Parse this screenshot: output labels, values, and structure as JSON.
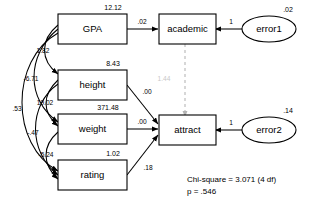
{
  "diagram": {
    "type": "sem-path-diagram",
    "title": "",
    "background_color": "#ffffff",
    "line_color": "#000000",
    "faded_color": "#c8c8c8"
  },
  "observed_variables": [
    {
      "id": "gpa",
      "label": "GPA",
      "variance": "12.12"
    },
    {
      "id": "height",
      "label": "height",
      "variance": "8.43"
    },
    {
      "id": "weight",
      "label": "weight",
      "variance": "371.48"
    },
    {
      "id": "rating",
      "label": "rating",
      "variance": "1.02"
    }
  ],
  "endogenous_variables": [
    {
      "id": "academic",
      "label": "academic"
    },
    {
      "id": "attract",
      "label": "attract"
    }
  ],
  "error_terms": [
    {
      "id": "error1",
      "label": "error1",
      "variance": ".02",
      "loading": "1"
    },
    {
      "id": "error2",
      "label": "error2",
      "variance": ".14",
      "loading": "1"
    }
  ],
  "regression_paths": [
    {
      "from": "gpa",
      "to": "academic",
      "coefficient": ".02",
      "style": "solid"
    },
    {
      "from": "height",
      "to": "attract",
      "coefficient": ".00",
      "style": "solid"
    },
    {
      "from": "weight",
      "to": "attract",
      "coefficient": ".00",
      "style": "solid"
    },
    {
      "from": "rating",
      "to": "attract",
      "coefficient": ".18",
      "style": "solid"
    },
    {
      "from": "academic",
      "to": "attract",
      "coefficient": "1.44",
      "style": "dashed"
    }
  ],
  "covariances": [
    {
      "between": "gpa-height",
      "value": "1.82"
    },
    {
      "between": "gpa-weight",
      "value": "-6.71"
    },
    {
      "between": "height-weight",
      "value": "19.02"
    },
    {
      "between": "gpa-rating",
      "value": ".53"
    },
    {
      "between": "height-rating",
      "value": "-.47"
    },
    {
      "between": "weight-rating",
      "value": "-5.24"
    }
  ],
  "fit_statistics": {
    "chi_square_line": "Chi-square = 3.071 (4 df)",
    "p_line": "p = .546",
    "chi_square_value": "3.071",
    "degrees_of_freedom": "4",
    "p_value": ".546"
  }
}
